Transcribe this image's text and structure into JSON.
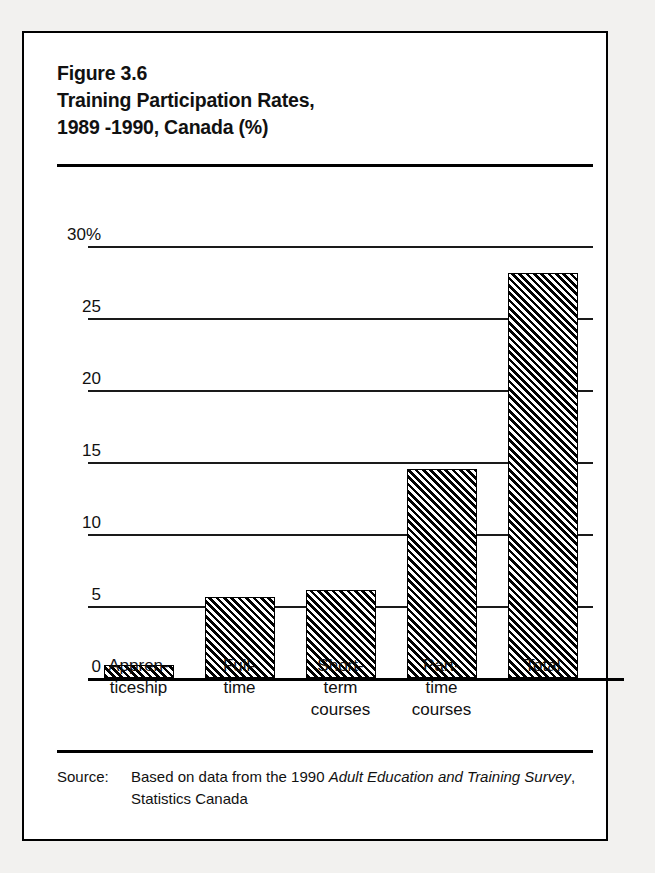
{
  "figure": {
    "title_lines": [
      "Figure 3.6",
      "Training Participation Rates,",
      "1989 -1990, Canada (%)"
    ],
    "source_label": "Source:",
    "source_text_part1": "Based on data from the 1990 ",
    "source_italic1": "Adult Education and Training Survey",
    "source_text_part2": ", Statistics Canada"
  },
  "chart_data": {
    "type": "bar",
    "title": "Training Participation Rates, 1989 -1990, Canada (%)",
    "categories": [
      "Appren-\nticeship",
      "Full-\ntime",
      "Short-\nterm\ncourses",
      "Part-\ntime\ncourses",
      "Total"
    ],
    "category_lines": [
      [
        "Appren-",
        "ticeship"
      ],
      [
        "Full-",
        "time"
      ],
      [
        "Short-",
        "term",
        "courses"
      ],
      [
        "Part-",
        "time",
        "courses"
      ],
      [
        "Total"
      ]
    ],
    "values": [
      0.9,
      5.6,
      6.1,
      14.5,
      28.1
    ],
    "xlabel": "",
    "ylabel": "",
    "ylim": [
      0,
      30
    ],
    "yticks": [
      0,
      5,
      10,
      15,
      20,
      25,
      30
    ],
    "ytick_labels": [
      "0",
      "5",
      "10",
      "15",
      "20",
      "25",
      "30%"
    ],
    "grid": true,
    "legend": "none",
    "bar_fill": "diagonal-hatch",
    "bar_color": "#000000"
  }
}
